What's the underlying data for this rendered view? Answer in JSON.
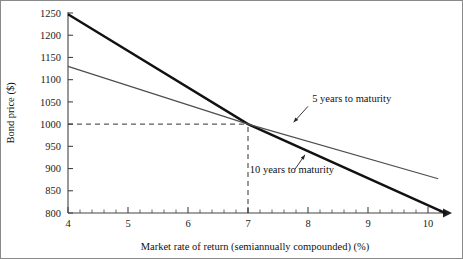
{
  "chart_data": {
    "type": "line",
    "title": "",
    "xlabel": "Market rate of return (semiannually compounded) (%)",
    "ylabel": "Bond price ($)",
    "xlim": [
      4,
      10.4
    ],
    "ylim": [
      800,
      1250
    ],
    "xticks": [
      4,
      5,
      6,
      7,
      8,
      9,
      10
    ],
    "xtick_labels": [
      "4",
      "5",
      "6",
      "7",
      "8",
      "9",
      "10"
    ],
    "x_minor_per_major": 5,
    "yticks": [
      800,
      850,
      900,
      950,
      1000,
      1050,
      1100,
      1150,
      1200,
      1250
    ],
    "ytick_labels": [
      "800",
      "850",
      "900",
      "950",
      "1000",
      "1050",
      "1100",
      "1150",
      "1200",
      "1250"
    ],
    "grid": false,
    "legend_position": "inline-annotations",
    "series": [
      {
        "name": "10 years to maturity",
        "style": "thick",
        "color": "#111111",
        "x": [
          4,
          7,
          10.3
        ],
        "y": [
          1247,
          1000,
          799
        ]
      },
      {
        "name": "5 years to maturity",
        "style": "thin",
        "color": "#4d4d4d",
        "x": [
          4,
          7,
          10.17
        ],
        "y": [
          1130,
          1000,
          877
        ]
      }
    ],
    "annotations": [
      {
        "id": "annotation-5y",
        "text": "5 years to maturity",
        "text_x": 8.07,
        "text_y": 1050,
        "arrow_from_x": 8.0,
        "arrow_from_y": 1040,
        "arrow_to_x": 7.76,
        "arrow_to_y": 1004
      },
      {
        "id": "annotation-10y",
        "text": "10 years to maturity",
        "text_x": 7.03,
        "text_y": 889,
        "arrow_from_x": 7.78,
        "arrow_from_y": 898,
        "arrow_to_x": 7.95,
        "arrow_to_y": 931
      }
    ],
    "guides": [
      {
        "id": "guide-horizontal-1000",
        "orientation": "horizontal",
        "value": 1000,
        "from": 4,
        "to": 7,
        "dashed": true
      },
      {
        "id": "guide-vertical-7",
        "orientation": "vertical",
        "value": 7,
        "from": 800,
        "to": 1000,
        "dashed": true
      }
    ],
    "x_axis_arrow": true
  },
  "colors": {
    "background": "#ffffff",
    "frame": "#8a8a8a",
    "axis": "#444444",
    "thick_series": "#111111",
    "thin_series": "#4d4d4d",
    "guide": "#333333",
    "text": "#111111"
  }
}
